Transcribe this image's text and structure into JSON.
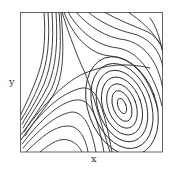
{
  "figure": {
    "type": "phase-portrait",
    "x_label": "x",
    "y_label": "y",
    "frame": {
      "left": 20,
      "top": 12,
      "right": 163,
      "bottom": 152
    },
    "features": {
      "saddle_point": {
        "x": 85,
        "y": 73
      },
      "center": {
        "x": 122,
        "y": 106
      },
      "orbits_around_center": 7,
      "separatrices": 2
    },
    "line_color": "#2a2a2a",
    "background": "#ffffff"
  }
}
